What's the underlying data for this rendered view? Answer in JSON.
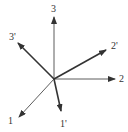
{
  "diagram": {
    "type": "coordinate-frames",
    "origin": [
      54,
      79
    ],
    "axes": [
      {
        "id": "axis-1",
        "label": "1",
        "end": [
          19,
          117
        ],
        "label_pos": [
          8,
          124
        ],
        "thick": false
      },
      {
        "id": "axis-2",
        "label": "2",
        "end": [
          115,
          79
        ],
        "label_pos": [
          119,
          82
        ],
        "thick": false
      },
      {
        "id": "axis-3",
        "label": "3",
        "end": [
          54,
          17
        ],
        "label_pos": [
          51,
          12
        ],
        "thick": false
      },
      {
        "id": "axis-1p",
        "label": "1'",
        "end": [
          61,
          111
        ],
        "label_pos": [
          60,
          127
        ],
        "thick": true
      },
      {
        "id": "axis-2p",
        "label": "2'",
        "end": [
          106,
          50
        ],
        "label_pos": [
          111,
          49
        ],
        "thick": true
      },
      {
        "id": "axis-3p",
        "label": "3'",
        "end": [
          18,
          43
        ],
        "label_pos": [
          9,
          40
        ],
        "thick": true
      }
    ],
    "colors": {
      "line": "#333333"
    }
  }
}
